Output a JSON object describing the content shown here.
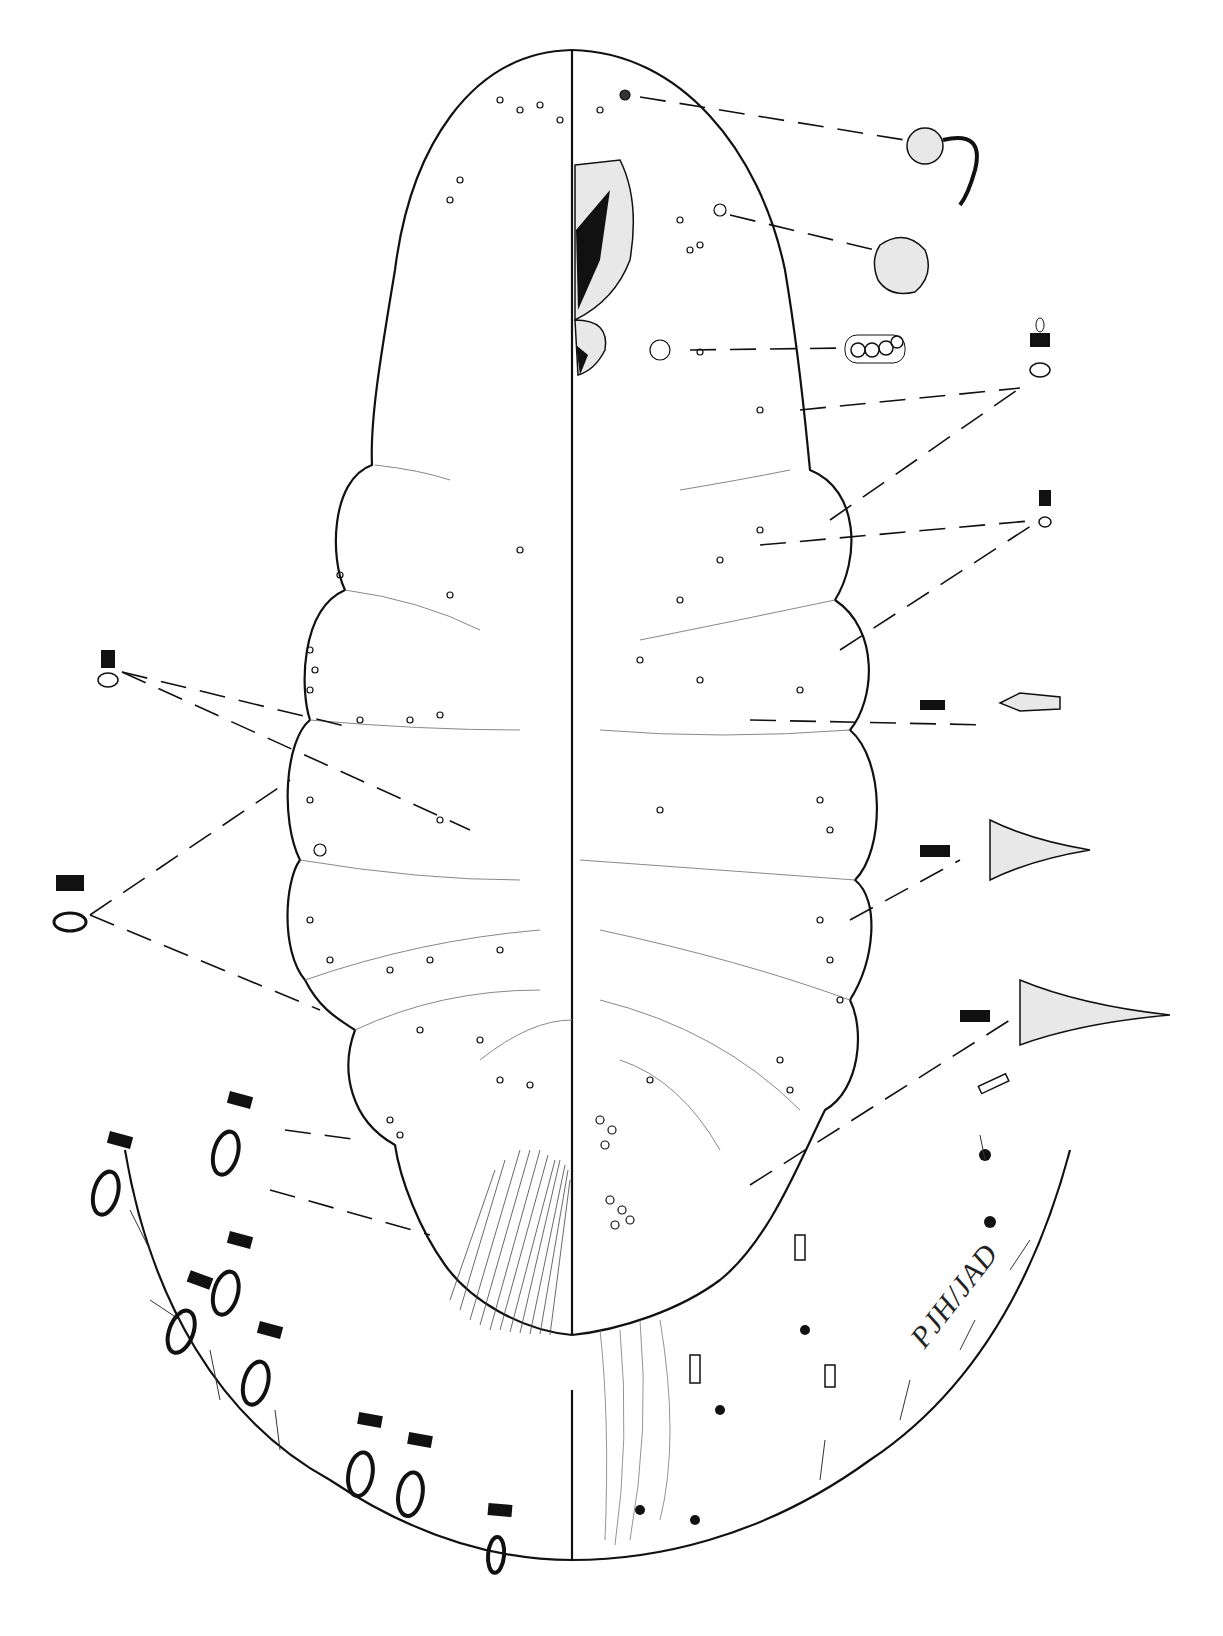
{
  "plate": {
    "subject": "scale insect (mealybug) adult female, dorsal/ventral morphology illustration",
    "signature": "PJH/JAD",
    "colors": {
      "ink": "#111111",
      "paper": "#ffffff",
      "stipple": "#e8e8e8"
    },
    "callouts_right": [
      {
        "name": "tubular-duct-with-filament",
        "y": 150
      },
      {
        "name": "oral-rim-pore",
        "y": 255
      },
      {
        "name": "multilocular-disc-pore-cluster",
        "y": 345
      },
      {
        "name": "oral-collar-tubular-duct-large",
        "y": 360
      },
      {
        "name": "oral-collar-tubular-duct-small",
        "y": 495
      },
      {
        "name": "flagellate-seta-spine",
        "y": 700
      },
      {
        "name": "cerarian-spine-triangular-1",
        "y": 840
      },
      {
        "name": "cerarian-spine-triangular-2",
        "y": 1000
      },
      {
        "name": "small-tubular-duct",
        "y": 1075
      }
    ],
    "callouts_left": [
      {
        "name": "oral-collar-duct-small-left",
        "y": 680
      },
      {
        "name": "oral-collar-duct-large-left",
        "y": 910
      }
    ]
  }
}
